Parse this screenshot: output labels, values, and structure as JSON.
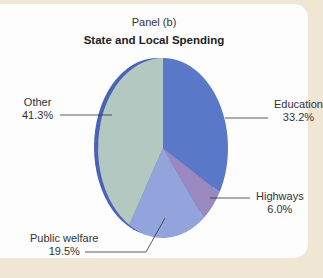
{
  "chart_data": {
    "type": "pie",
    "panel": "Panel (b)",
    "title": "State and Local Spending",
    "categories": [
      "Education",
      "Highways",
      "Public welfare",
      "Other"
    ],
    "values": [
      33.2,
      6.0,
      19.5,
      41.3
    ],
    "labels": [
      "33.2%",
      "6.0%",
      "19.5%",
      "41.3%"
    ],
    "colors": [
      "#5a78c8",
      "#9a88c0",
      "#93a4dc",
      "#b2c8c0"
    ],
    "start_angle_deg": 0,
    "direction": "clockwise",
    "legend": "none (leader-line labels)"
  },
  "labels": {
    "education": {
      "name": "Education",
      "value": "33.2%"
    },
    "highways": {
      "name": "Highways",
      "value": "6.0%"
    },
    "public_welfare": {
      "name": "Public welfare",
      "value": "19.5%"
    },
    "other": {
      "name": "Other",
      "value": "41.3%"
    }
  }
}
